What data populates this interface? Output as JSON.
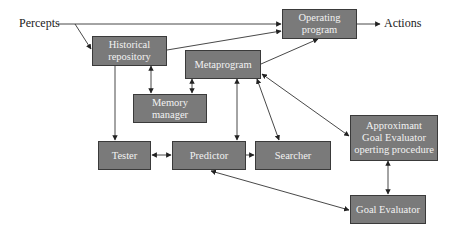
{
  "diagram": {
    "external_labels": {
      "input": "Percepts",
      "output": "Actions"
    },
    "nodes": [
      {
        "id": "historical",
        "label": "Historical\nrepository"
      },
      {
        "id": "operating",
        "label": "Operating\nprogram"
      },
      {
        "id": "metaprogram",
        "label": "Metaprogram"
      },
      {
        "id": "memory",
        "label": "Memory\nmanager"
      },
      {
        "id": "tester",
        "label": "Tester"
      },
      {
        "id": "predictor",
        "label": "Predictor"
      },
      {
        "id": "searcher",
        "label": "Searcher"
      },
      {
        "id": "approximant",
        "label": "Approximant\nGoal Evaluator\noperting procedure"
      },
      {
        "id": "goal_evaluator",
        "label": "Goal Evaluator"
      }
    ],
    "edges": [
      {
        "from": "Percepts",
        "to": "historical",
        "direction": "forward"
      },
      {
        "from": "Percepts",
        "to": "operating",
        "direction": "forward"
      },
      {
        "from": "historical",
        "to": "operating",
        "direction": "forward"
      },
      {
        "from": "operating",
        "to": "Actions",
        "direction": "forward"
      },
      {
        "from": "metaprogram",
        "to": "operating",
        "direction": "forward"
      },
      {
        "from": "historical",
        "to": "memory",
        "direction": "both"
      },
      {
        "from": "metaprogram",
        "to": "memory",
        "direction": "both"
      },
      {
        "from": "historical",
        "to": "tester",
        "direction": "forward"
      },
      {
        "from": "metaprogram",
        "to": "predictor",
        "direction": "both"
      },
      {
        "from": "metaprogram",
        "to": "searcher",
        "direction": "both"
      },
      {
        "from": "metaprogram",
        "to": "approximant",
        "direction": "both"
      },
      {
        "from": "tester",
        "to": "predictor",
        "direction": "both"
      },
      {
        "from": "predictor",
        "to": "searcher",
        "direction": "forward"
      },
      {
        "from": "approximant",
        "to": "goal_evaluator",
        "direction": "both"
      },
      {
        "from": "predictor",
        "to": "goal_evaluator",
        "direction": "both"
      }
    ],
    "colors": {
      "box_fill": "#7a7a7a",
      "box_border": "#3a3a3a",
      "box_text": "#f2f2f2",
      "line": "#333333"
    }
  }
}
